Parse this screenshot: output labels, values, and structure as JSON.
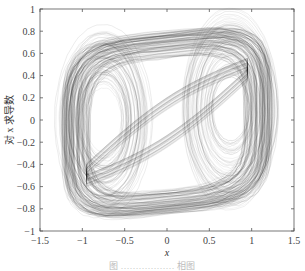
{
  "chart_data": {
    "type": "line",
    "subtype": "phase-portrait",
    "title": "",
    "xlabel": "x",
    "ylabel": "对 x 求导数",
    "xlim": [
      -1.5,
      1.5
    ],
    "ylim": [
      -1,
      1
    ],
    "xticks": [
      -1.5,
      -1,
      -0.5,
      0,
      0.5,
      1,
      1.5
    ],
    "xtick_labels": [
      "−1.5",
      "−1",
      "−0.5",
      "0",
      "0.5",
      "1",
      "1.5"
    ],
    "yticks": [
      -1,
      -0.8,
      -0.6,
      -0.4,
      -0.2,
      0,
      0.2,
      0.4,
      0.6,
      0.8,
      1
    ],
    "ytick_labels": [
      "−1",
      "−0.8",
      "−0.6",
      "−0.4",
      "−0.2",
      "0",
      "0.2",
      "0.4",
      "0.6",
      "0.8",
      "1"
    ],
    "grid": false,
    "legend": null,
    "envelope": {
      "x_min": -1.25,
      "x_max": 1.25,
      "y_min": -0.85,
      "y_max": 0.8
    },
    "inner_loops": [
      {
        "cx": -0.75,
        "cy": 0.0,
        "rx": 0.2,
        "ry": 0.3
      },
      {
        "cx": 0.75,
        "cy": 0.1,
        "rx": 0.2,
        "ry": 0.3
      }
    ],
    "line_color": "#222222"
  },
  "caption": {
    "text": "图 ……………… 相图"
  }
}
